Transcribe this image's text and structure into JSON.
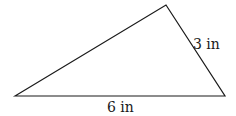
{
  "figure": {
    "type": "triangle",
    "vertices": {
      "left": [
        15,
        96
      ],
      "top": [
        166,
        5
      ],
      "right": [
        225,
        96
      ]
    },
    "stroke_color": "#1a1a1a",
    "labels": {
      "right_side": "3 in",
      "base": "6 in"
    }
  }
}
